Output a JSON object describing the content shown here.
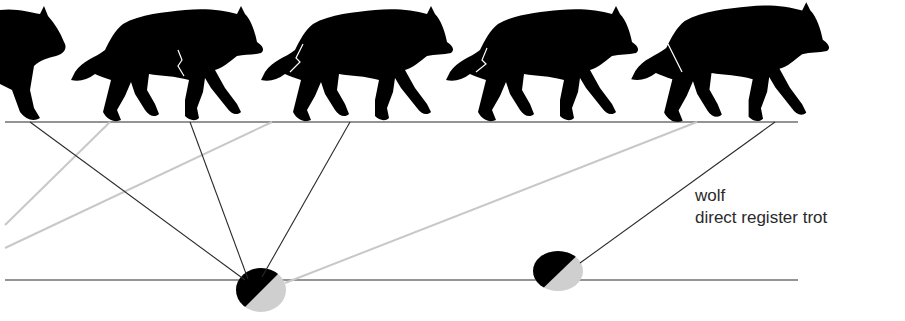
{
  "diagram": {
    "title": "wolf",
    "subtitle": "direct register trot",
    "colors": {
      "silhouette": "#000000",
      "dark_line": "#2a2a2a",
      "light_line": "#c8c8c8",
      "footprint_dark": "#000000",
      "footprint_light": "#cfcfcf",
      "background": "#ffffff"
    },
    "ground_lines": [
      {
        "name": "top-ground-line",
        "x1": 5,
        "y1": 122,
        "x2": 798,
        "y2": 122
      },
      {
        "name": "track-line",
        "x1": 5,
        "y1": 280,
        "x2": 798,
        "y2": 280
      }
    ],
    "wolves": [
      {
        "name": "wolf-1",
        "x": -40,
        "partial": true
      },
      {
        "name": "wolf-2",
        "x": 65
      },
      {
        "name": "wolf-3",
        "x": 260
      },
      {
        "name": "wolf-4",
        "x": 445
      },
      {
        "name": "wolf-5",
        "x": 628
      }
    ],
    "footprints": [
      {
        "name": "footprint-1",
        "cx": 261,
        "cy": 290,
        "rx": 25,
        "ry": 22
      },
      {
        "name": "footprint-2",
        "cx": 558,
        "cy": 271,
        "rx": 25,
        "ry": 20
      }
    ],
    "projection_lines": {
      "dark": [
        {
          "x1": 30,
          "y1": 122,
          "x2": 245,
          "y2": 280
        },
        {
          "x1": 190,
          "y1": 122,
          "x2": 248,
          "y2": 279
        },
        {
          "x1": 350,
          "y1": 122,
          "x2": 262,
          "y2": 277
        },
        {
          "x1": 775,
          "y1": 122,
          "x2": 580,
          "y2": 263
        }
      ],
      "light": [
        {
          "x1": 110,
          "y1": 122,
          "x2": 5,
          "y2": 225
        },
        {
          "x1": 272,
          "y1": 122,
          "x2": 5,
          "y2": 248
        },
        {
          "x1": 697,
          "y1": 122,
          "x2": 285,
          "y2": 283
        }
      ]
    }
  }
}
